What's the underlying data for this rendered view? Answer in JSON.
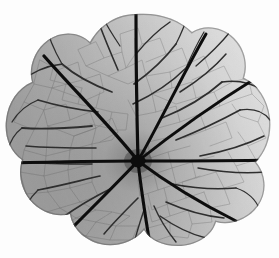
{
  "image": {
    "subject": "leaf-specimen",
    "common_name": "Nasturtium leaf",
    "description": "Grayscale backlit photograph of a round peltate leaf showing radiating palmate venation",
    "rendering": "grayscale",
    "background_color": "#fdfdfd",
    "canvas": {
      "width": 279,
      "height": 258
    }
  },
  "leaf": {
    "shape": "orbicular-peltate",
    "margin": "crenate-lobed",
    "lobe_count": 9,
    "petiole_attachment": "peltate-central",
    "hub": {
      "x": 138,
      "y": 161
    },
    "bounds": {
      "left": 8,
      "right": 274,
      "top": 14,
      "bottom": 246
    },
    "lamina_tone_left": "#8c8c8c",
    "lamina_tone_center": "#c4c4c4",
    "lamina_tone_right": "#ededed",
    "vein_color": "#111111",
    "minor_vein_color": "#6b6b6b",
    "lighting": "gradient brighter toward upper-right"
  },
  "veins": {
    "primary_count": 9,
    "primary_endpoints": [
      {
        "name": "vein-north",
        "x": 136,
        "y": 14
      },
      {
        "name": "vein-northeast",
        "x": 206,
        "y": 35
      },
      {
        "name": "vein-east-upper",
        "x": 256,
        "y": 78
      },
      {
        "name": "vein-east",
        "x": 274,
        "y": 160
      },
      {
        "name": "vein-southeast",
        "x": 236,
        "y": 221
      },
      {
        "name": "vein-south",
        "x": 150,
        "y": 245
      },
      {
        "name": "vein-southwest",
        "x": 68,
        "y": 232
      },
      {
        "name": "vein-west",
        "x": 9,
        "y": 163
      },
      {
        "name": "vein-northwest",
        "x": 44,
        "y": 56
      }
    ],
    "venation_pattern": "palmate-actinodromous with reticulate areoles"
  }
}
